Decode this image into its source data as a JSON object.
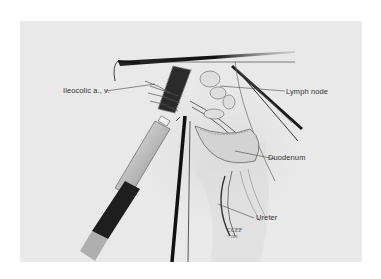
{
  "figure": {
    "type": "surgical-illustration",
    "background_color": "#e9e9e9",
    "labels": [
      {
        "id": "ileocolic",
        "text": "Ileocolic a., v."
      },
      {
        "id": "lymph_node",
        "text": "Lymph node"
      },
      {
        "id": "duodenum",
        "text": "Duodenum"
      },
      {
        "id": "ureter",
        "text": "Ureter"
      }
    ],
    "signature": {
      "name": "CCEF",
      "copyright": "© 1996"
    },
    "structures": [
      "instrument-upper-grasper",
      "instrument-right-grasper",
      "instrument-stapler",
      "instrument-center-grasper",
      "mesentery-stapled-pedicle",
      "lymph-nodes",
      "duodenum",
      "ureter",
      "retroperitoneum"
    ]
  }
}
